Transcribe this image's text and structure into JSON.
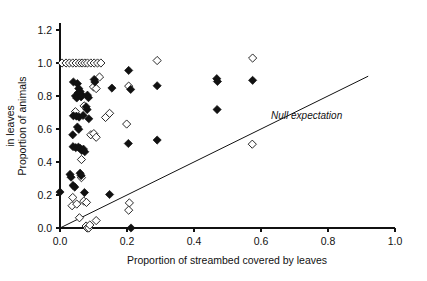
{
  "chart_data": {
    "type": "scatter",
    "title": "",
    "xlabel": "Proportion of streambed covered by leaves",
    "ylabel_line1": "Proportion of animals",
    "ylabel_line2": "in leaves",
    "ylabel": "Proportion of animals in leaves",
    "xlim": [
      0.0,
      1.0
    ],
    "ylim": [
      0.0,
      1.2
    ],
    "xticks": [
      0.0,
      0.2,
      0.4,
      0.6,
      0.8,
      1.0
    ],
    "xtick_labels": [
      "0.0",
      "0.2",
      "0.4",
      "0.6",
      "0.8",
      "1.0"
    ],
    "yticks": [
      0.0,
      0.2,
      0.4,
      0.6,
      0.8,
      1.0,
      1.2
    ],
    "ytick_labels": [
      "0.0",
      "0.2",
      "0.4",
      "0.6",
      "0.8",
      "1.0",
      "1.2"
    ],
    "grid": false,
    "legend": null,
    "annotations": [
      {
        "text": "Null expectation",
        "x": 0.63,
        "y": 0.66,
        "style": "italic"
      }
    ],
    "reference_line": {
      "name": "Null expectation",
      "type": "identity",
      "from": [
        0.0,
        0.0
      ],
      "to": [
        0.92,
        0.92
      ],
      "slope": 1.0,
      "intercept": 0.0,
      "color": "#111111"
    },
    "marker_colors": {
      "filled": "#111111",
      "open_fill": "#ffffff",
      "open_stroke": "#111111"
    },
    "series": [
      {
        "name": "open-diamonds",
        "marker": "diamond-open",
        "points": [
          [
            0.006,
            1.0
          ],
          [
            0.018,
            1.0
          ],
          [
            0.028,
            1.0
          ],
          [
            0.038,
            1.0
          ],
          [
            0.048,
            1.0
          ],
          [
            0.058,
            1.0
          ],
          [
            0.066,
            1.0
          ],
          [
            0.074,
            1.0
          ],
          [
            0.082,
            1.0
          ],
          [
            0.092,
            1.0
          ],
          [
            0.102,
            1.0
          ],
          [
            0.112,
            1.0
          ],
          [
            0.122,
            1.0
          ],
          [
            0.118,
            0.915
          ],
          [
            0.29,
            1.015
          ],
          [
            0.575,
            1.03
          ],
          [
            0.1,
            0.855
          ],
          [
            0.108,
            0.845
          ],
          [
            0.205,
            0.86
          ],
          [
            0.046,
            0.705
          ],
          [
            0.072,
            0.74
          ],
          [
            0.136,
            0.67
          ],
          [
            0.148,
            0.695
          ],
          [
            0.199,
            0.63
          ],
          [
            0.092,
            0.565
          ],
          [
            0.101,
            0.572
          ],
          [
            0.108,
            0.55
          ],
          [
            0.064,
            0.415
          ],
          [
            0.064,
            0.305
          ],
          [
            0.038,
            0.185
          ],
          [
            0.036,
            0.135
          ],
          [
            0.05,
            0.145
          ],
          [
            0.071,
            0.163
          ],
          [
            0.079,
            0.155
          ],
          [
            0.058,
            0.062
          ],
          [
            0.078,
            0.012
          ],
          [
            0.081,
            0.0
          ],
          [
            0.086,
            0.0
          ],
          [
            0.089,
            0.018
          ],
          [
            0.108,
            0.045
          ],
          [
            0.207,
            0.152
          ],
          [
            0.205,
            0.108
          ],
          [
            0.574,
            0.508
          ]
        ]
      },
      {
        "name": "filled-diamonds",
        "marker": "diamond-filled",
        "points": [
          [
            0.0,
            0.218
          ],
          [
            0.205,
            0.955
          ],
          [
            0.04,
            0.885
          ],
          [
            0.052,
            0.875
          ],
          [
            0.102,
            0.9
          ],
          [
            0.104,
            0.885
          ],
          [
            0.211,
            0.84
          ],
          [
            0.29,
            0.862
          ],
          [
            0.468,
            0.905
          ],
          [
            0.47,
            0.888
          ],
          [
            0.575,
            0.895
          ],
          [
            0.155,
            0.848
          ],
          [
            0.056,
            0.845
          ],
          [
            0.06,
            0.828
          ],
          [
            0.063,
            0.812
          ],
          [
            0.054,
            0.818
          ],
          [
            0.046,
            0.8
          ],
          [
            0.05,
            0.788
          ],
          [
            0.063,
            0.795
          ],
          [
            0.082,
            0.805
          ],
          [
            0.085,
            0.79
          ],
          [
            0.04,
            0.68
          ],
          [
            0.049,
            0.678
          ],
          [
            0.057,
            0.672
          ],
          [
            0.069,
            0.682
          ],
          [
            0.078,
            0.735
          ],
          [
            0.081,
            0.718
          ],
          [
            0.086,
            0.662
          ],
          [
            0.469,
            0.718
          ],
          [
            0.052,
            0.612
          ],
          [
            0.056,
            0.598
          ],
          [
            0.038,
            0.565
          ],
          [
            0.039,
            0.493
          ],
          [
            0.047,
            0.487
          ],
          [
            0.055,
            0.49
          ],
          [
            0.06,
            0.483
          ],
          [
            0.065,
            0.47
          ],
          [
            0.07,
            0.478
          ],
          [
            0.074,
            0.462
          ],
          [
            0.204,
            0.512
          ],
          [
            0.29,
            0.533
          ],
          [
            0.03,
            0.325
          ],
          [
            0.033,
            0.308
          ],
          [
            0.06,
            0.332
          ],
          [
            0.063,
            0.318
          ],
          [
            0.039,
            0.258
          ],
          [
            0.044,
            0.248
          ],
          [
            0.073,
            0.215
          ],
          [
            0.148,
            0.203
          ],
          [
            0.212,
            0.0
          ]
        ]
      }
    ]
  },
  "plot_geometry": {
    "left_px": 60,
    "right_px": 395,
    "bottom_px": 228,
    "top_y_value_px": 30
  }
}
